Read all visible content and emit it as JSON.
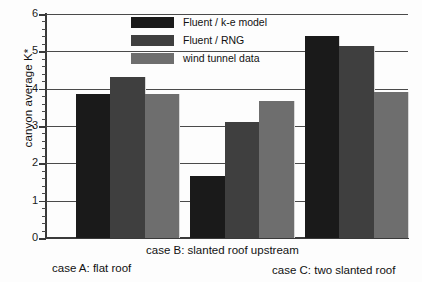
{
  "chart_data": {
    "type": "bar",
    "title": "",
    "xlabel": "",
    "ylabel": "canyon average K*",
    "ylim": [
      0,
      6
    ],
    "ytick_labels": [
      "0",
      "1",
      "2",
      "3",
      "4",
      "5",
      "6"
    ],
    "ytick_values": [
      0,
      1,
      2,
      3,
      4,
      5,
      6
    ],
    "minor_tick_interval": 0.2,
    "grid": "horizontal gridlines at each major y tick",
    "legend_position": "upper center",
    "categories": [
      "case A: flat roof",
      "case B: slanted roof upstream",
      "case C: two slanted roof"
    ],
    "series": [
      {
        "name": "Fluent / k-e model",
        "color": "#1a1a1a",
        "values": [
          3.85,
          1.65,
          5.4
        ]
      },
      {
        "name": "Fluent / RNG",
        "color": "#3f3f3f",
        "values": [
          4.3,
          3.1,
          5.15
        ]
      },
      {
        "name": "wind tunnel data",
        "color": "#6e6e6e",
        "values": [
          3.85,
          3.68,
          3.9
        ]
      }
    ]
  },
  "axis": {
    "y_title": "canyon average K*"
  },
  "legend": {
    "items": [
      {
        "label": "Fluent / k-e model",
        "color": "#1a1a1a"
      },
      {
        "label": "Fluent / RNG",
        "color": "#3f3f3f"
      },
      {
        "label": "wind tunnel data",
        "color": "#6e6e6e"
      }
    ]
  }
}
